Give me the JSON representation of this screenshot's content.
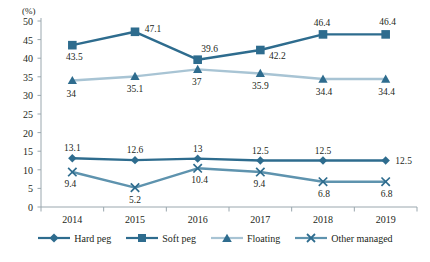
{
  "chart_data": {
    "type": "line",
    "title": "",
    "xlabel": "",
    "ylabel": "(%)",
    "categories": [
      "2014",
      "2015",
      "2016",
      "2017",
      "2018",
      "2019"
    ],
    "ylim": [
      0,
      50
    ],
    "yticks": [
      "0",
      "5",
      "10",
      "15",
      "20",
      "25",
      "30",
      "35",
      "40",
      "45",
      "50"
    ],
    "grid": false,
    "legend_position": "bottom",
    "series": [
      {
        "name": "Hard peg",
        "marker": "diamond",
        "color": "#2E6C8E",
        "values": [
          13.1,
          12.6,
          13,
          12.5,
          12.5,
          12.5
        ],
        "labels": [
          "13.1",
          "12.6",
          "13",
          "12.5",
          "12.5",
          "12.5"
        ]
      },
      {
        "name": "Soft peg",
        "marker": "square",
        "color": "#2E6C8E",
        "values": [
          43.5,
          47.1,
          39.6,
          42.2,
          46.4,
          46.4
        ],
        "labels": [
          "43.5",
          "47.1",
          "39.6",
          "42.2",
          "46.4",
          "46.4"
        ]
      },
      {
        "name": "Floating",
        "marker": "triangle",
        "color": "#A8C4D4",
        "values": [
          34,
          35.1,
          37,
          35.9,
          34.4,
          34.4
        ],
        "labels": [
          "34",
          "35.1",
          "37",
          "35.9",
          "34.4",
          "34.4"
        ]
      },
      {
        "name": "Other managed",
        "marker": "cross",
        "color": "#5E93AE",
        "values": [
          9.4,
          5.2,
          10.4,
          9.4,
          6.8,
          6.8
        ],
        "labels": [
          "9.4",
          "5.2",
          "10.4",
          "9.4",
          "6.8",
          "6.8"
        ]
      }
    ]
  },
  "colors": {
    "dark_blue": "#2E6C8E",
    "mid_blue": "#5E93AE",
    "light_blue": "#A8C4D4",
    "axis": "#9aa7ae",
    "text": "#231f20"
  }
}
